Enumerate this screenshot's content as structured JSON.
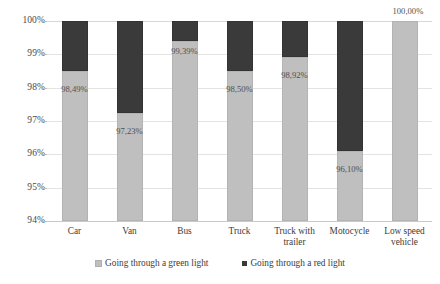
{
  "chart_data": {
    "type": "bar",
    "subtype": "stacked-bar",
    "title": "",
    "subtitle": "",
    "xlabel": "",
    "ylabel": "",
    "ylim": [
      94,
      100
    ],
    "ytick_labels": [
      "100%",
      "99%",
      "98%",
      "97%",
      "96%",
      "95%",
      "94%"
    ],
    "ytick_values": [
      100,
      99,
      98,
      97,
      96,
      95,
      94
    ],
    "grid": true,
    "legend_position": "bottom",
    "categories": [
      "Car",
      "Van",
      "Bus",
      "Truck",
      "Truck with trailer",
      "Motocycle",
      "Low speed vehicle"
    ],
    "series": [
      {
        "name": "Going through a green light",
        "color": "#BFBFBF",
        "values": [
          98.49,
          97.23,
          99.39,
          98.5,
          98.92,
          96.1,
          100.0
        ],
        "data_labels": [
          "98,49%",
          "97,23%",
          "99,39%",
          "98,50%",
          "98,92%",
          "96,10%",
          "100,00%"
        ]
      },
      {
        "name": "Going through a red light",
        "color": "#3A3A3A",
        "values": [
          1.51,
          2.77,
          0.61,
          1.5,
          1.08,
          3.9,
          0.0
        ],
        "data_labels": [
          "",
          "",
          "",
          "",
          "",
          "",
          ""
        ]
      }
    ]
  },
  "legend": {
    "items": [
      {
        "label": "Going through a green light",
        "swatch": "green"
      },
      {
        "label": "Going through a red light",
        "swatch": "red"
      }
    ]
  }
}
